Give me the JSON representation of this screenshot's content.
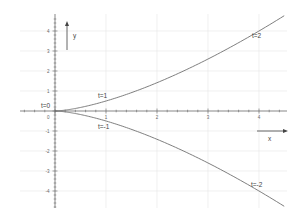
{
  "chart_data": {
    "type": "line",
    "title": "",
    "xlabel": "x",
    "ylabel": "y",
    "xlim": [
      -0.7,
      4.6
    ],
    "ylim": [
      -4.8,
      4.8
    ],
    "grid": true,
    "x_ticks": [
      "1",
      "2",
      "3",
      "4"
    ],
    "y_ticks": [
      "4",
      "3",
      "2",
      "1",
      "0",
      "-1",
      "-2",
      "-3",
      "-4"
    ],
    "series": [
      {
        "name": "upper branch (t>=0)",
        "x": [
          0,
          0.25,
          1,
          2.25,
          4,
          4.5
        ],
        "y": [
          0,
          0.0625,
          0.5,
          1.6875,
          4,
          4.77
        ]
      },
      {
        "name": "lower branch (t<=0)",
        "x": [
          0,
          0.25,
          1,
          2.25,
          4,
          4.5
        ],
        "y": [
          0,
          -0.0625,
          -0.5,
          -1.6875,
          -4,
          -4.77
        ]
      }
    ],
    "annotations": [
      {
        "text": "t=0",
        "x": 0,
        "y": 0
      },
      {
        "text": "t=1",
        "x": 1,
        "y": 0.5
      },
      {
        "text": "t=-1",
        "x": 1,
        "y": -0.5
      },
      {
        "text": "t=2",
        "x": 4,
        "y": 4
      },
      {
        "text": "t=-2",
        "x": 4,
        "y": -4
      }
    ]
  },
  "labels": {
    "x_axis": "x",
    "y_axis": "y",
    "origin_tick": "0",
    "t0": "t=0",
    "t1": "t=1",
    "tm1": "t=-1",
    "t2": "t=2",
    "tm2": "t=-2"
  }
}
